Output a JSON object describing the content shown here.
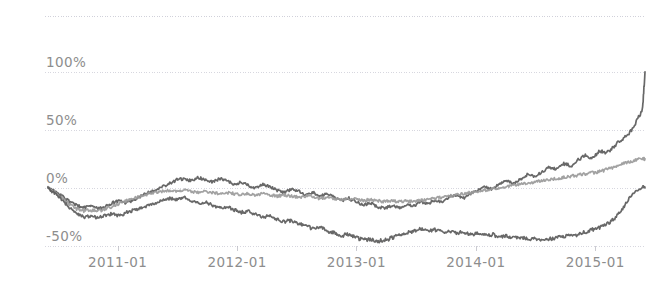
{
  "chart_data": {
    "type": "line",
    "title": "",
    "subtitle": "",
    "xlabel": "",
    "ylabel": "",
    "grid": true,
    "legend": "none",
    "xlim": [
      "2010-06",
      "2015-06"
    ],
    "ylim": [
      -50,
      148
    ],
    "y_ticks": [
      100,
      50,
      0,
      -50
    ],
    "y_tick_labels": [
      "100%",
      "50%",
      "0%",
      "-50%"
    ],
    "x_ticks": [
      "2011-01",
      "2012-01",
      "2013-01",
      "2014-01",
      "2015-01"
    ],
    "x_tick_labels": [
      "2011-01",
      "2012-01",
      "2013-01",
      "2014-01",
      "2015-01"
    ],
    "x_start": "2010-06",
    "x_end": "2015-06",
    "annotations": [],
    "series": [
      {
        "name": "series-1",
        "color": "#5b5b5b",
        "end_value": 100,
        "x": [
          0.0,
          0.012,
          0.024,
          0.036,
          0.048,
          0.06,
          0.072,
          0.084,
          0.096,
          0.108,
          0.12,
          0.132,
          0.144,
          0.156,
          0.168,
          0.18,
          0.192,
          0.204,
          0.216,
          0.228,
          0.24,
          0.252,
          0.264,
          0.276,
          0.288,
          0.3,
          0.312,
          0.324,
          0.336,
          0.348,
          0.36,
          0.372,
          0.384,
          0.396,
          0.408,
          0.42,
          0.432,
          0.444,
          0.456,
          0.468,
          0.48,
          0.492,
          0.504,
          0.516,
          0.528,
          0.54,
          0.552,
          0.564,
          0.576,
          0.588,
          0.6,
          0.612,
          0.624,
          0.636,
          0.648,
          0.66,
          0.672,
          0.684,
          0.696,
          0.708,
          0.72,
          0.732,
          0.744,
          0.756,
          0.768,
          0.78,
          0.792,
          0.804,
          0.816,
          0.828,
          0.84,
          0.852,
          0.864,
          0.876,
          0.888,
          0.9,
          0.912,
          0.924,
          0.936,
          0.948,
          0.96,
          0.972,
          0.984,
          0.996,
          1.0
        ],
        "values": [
          0,
          -3,
          -7,
          -12,
          -15,
          -17,
          -16,
          -18,
          -16,
          -13,
          -11,
          -13,
          -10,
          -7,
          -4,
          -2,
          1,
          4,
          7,
          8,
          6,
          9,
          7,
          5,
          8,
          6,
          3,
          5,
          2,
          0,
          3,
          1,
          -2,
          -4,
          -1,
          -3,
          -6,
          -4,
          -7,
          -5,
          -8,
          -11,
          -9,
          -12,
          -15,
          -13,
          -16,
          -18,
          -15,
          -17,
          -14,
          -16,
          -12,
          -14,
          -10,
          -12,
          -8,
          -6,
          -9,
          -5,
          -2,
          1,
          -1,
          3,
          6,
          4,
          8,
          12,
          10,
          14,
          18,
          16,
          21,
          19,
          24,
          28,
          26,
          32,
          30,
          36,
          41,
          46,
          55,
          68,
          100
        ]
      },
      {
        "name": "series-2",
        "color": "#9a9a9a",
        "end_value": 25,
        "x": [
          0.0,
          0.012,
          0.024,
          0.036,
          0.048,
          0.06,
          0.072,
          0.084,
          0.096,
          0.108,
          0.12,
          0.132,
          0.144,
          0.156,
          0.168,
          0.18,
          0.192,
          0.204,
          0.216,
          0.228,
          0.24,
          0.252,
          0.264,
          0.276,
          0.288,
          0.3,
          0.312,
          0.324,
          0.336,
          0.348,
          0.36,
          0.372,
          0.384,
          0.396,
          0.408,
          0.42,
          0.432,
          0.444,
          0.456,
          0.468,
          0.48,
          0.492,
          0.504,
          0.516,
          0.528,
          0.54,
          0.552,
          0.564,
          0.576,
          0.588,
          0.6,
          0.612,
          0.624,
          0.636,
          0.648,
          0.66,
          0.672,
          0.684,
          0.696,
          0.708,
          0.72,
          0.732,
          0.744,
          0.756,
          0.768,
          0.78,
          0.792,
          0.804,
          0.816,
          0.828,
          0.84,
          0.852,
          0.864,
          0.876,
          0.888,
          0.9,
          0.912,
          0.924,
          0.936,
          0.948,
          0.96,
          0.972,
          0.984,
          0.996,
          1.0
        ],
        "values": [
          0,
          -4,
          -9,
          -14,
          -18,
          -20,
          -19,
          -20,
          -18,
          -16,
          -13,
          -11,
          -9,
          -7,
          -5,
          -4,
          -3,
          -2,
          -3,
          -2,
          -3,
          -4,
          -3,
          -4,
          -5,
          -4,
          -5,
          -6,
          -5,
          -6,
          -5,
          -6,
          -7,
          -6,
          -7,
          -8,
          -7,
          -8,
          -9,
          -8,
          -9,
          -10,
          -9,
          -10,
          -11,
          -10,
          -11,
          -12,
          -11,
          -12,
          -11,
          -12,
          -11,
          -10,
          -9,
          -8,
          -7,
          -6,
          -5,
          -4,
          -3,
          -2,
          -1,
          0,
          1,
          2,
          3,
          4,
          5,
          6,
          7,
          8,
          9,
          10,
          11,
          12,
          13,
          14,
          16,
          18,
          20,
          22,
          24,
          25,
          25
        ]
      },
      {
        "name": "series-3",
        "color": "#5b5b5b",
        "end_value": 0,
        "x": [
          0.0,
          0.012,
          0.024,
          0.036,
          0.048,
          0.06,
          0.072,
          0.084,
          0.096,
          0.108,
          0.12,
          0.132,
          0.144,
          0.156,
          0.168,
          0.18,
          0.192,
          0.204,
          0.216,
          0.228,
          0.24,
          0.252,
          0.264,
          0.276,
          0.288,
          0.3,
          0.312,
          0.324,
          0.336,
          0.348,
          0.36,
          0.372,
          0.384,
          0.396,
          0.408,
          0.42,
          0.432,
          0.444,
          0.456,
          0.468,
          0.48,
          0.492,
          0.504,
          0.516,
          0.528,
          0.54,
          0.552,
          0.564,
          0.576,
          0.588,
          0.6,
          0.612,
          0.624,
          0.636,
          0.648,
          0.66,
          0.672,
          0.684,
          0.696,
          0.708,
          0.72,
          0.732,
          0.744,
          0.756,
          0.768,
          0.78,
          0.792,
          0.804,
          0.816,
          0.828,
          0.84,
          0.852,
          0.864,
          0.876,
          0.888,
          0.9,
          0.912,
          0.924,
          0.936,
          0.948,
          0.96,
          0.972,
          0.984,
          0.996,
          1.0
        ],
        "values": [
          0,
          -5,
          -11,
          -17,
          -22,
          -25,
          -24,
          -26,
          -24,
          -22,
          -24,
          -21,
          -19,
          -17,
          -15,
          -13,
          -11,
          -9,
          -10,
          -8,
          -11,
          -13,
          -12,
          -15,
          -17,
          -16,
          -19,
          -21,
          -20,
          -23,
          -25,
          -24,
          -27,
          -29,
          -28,
          -31,
          -33,
          -35,
          -34,
          -37,
          -39,
          -41,
          -40,
          -43,
          -45,
          -44,
          -46,
          -45,
          -43,
          -41,
          -39,
          -37,
          -35,
          -37,
          -36,
          -38,
          -37,
          -39,
          -38,
          -40,
          -39,
          -41,
          -40,
          -42,
          -41,
          -43,
          -42,
          -44,
          -43,
          -45,
          -44,
          -43,
          -42,
          -41,
          -40,
          -38,
          -36,
          -34,
          -31,
          -27,
          -20,
          -10,
          -3,
          1,
          0
        ]
      }
    ]
  },
  "axes": {
    "y_labels": [
      "100%",
      "50%",
      "0%",
      "-50%"
    ],
    "x_labels": [
      "2011-01",
      "2012-01",
      "2013-01",
      "2014-01",
      "2015-01"
    ]
  },
  "style": {
    "background": "#ffffff",
    "grid_color": "#c9c9d4",
    "tick_color": "#b5b5be",
    "label_color": "#8d8d8d",
    "series_dark": "#5b5b5b",
    "series_light": "#9a9a9a"
  }
}
